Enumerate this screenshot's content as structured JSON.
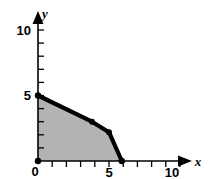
{
  "figure": {
    "background_color": "#ffffff",
    "region_fill_color": "#b3b3b3",
    "boundary_color": "#000000",
    "axis_color": "#000000"
  },
  "axes": {
    "x": {
      "name": "x",
      "tick_labels": [
        "0",
        "5",
        "10"
      ],
      "labeled_ticks": [
        0,
        5,
        10
      ],
      "minor_ticks": [
        1,
        2,
        3,
        4,
        6,
        7,
        8,
        9
      ],
      "range": [
        0,
        10
      ],
      "origin_label": "0"
    },
    "y": {
      "name": "y",
      "tick_labels": [
        "5",
        "10"
      ],
      "labeled_ticks": [
        5,
        10
      ],
      "minor_ticks": [
        1,
        2,
        3,
        4,
        6,
        7,
        8,
        9
      ],
      "range": [
        0,
        10
      ]
    }
  },
  "chart_data": {
    "type": "area",
    "title": "",
    "subtitle": "",
    "xlabel": "x",
    "ylabel": "y",
    "xlim": [
      0,
      10
    ],
    "ylim": [
      0,
      10
    ],
    "grid": false,
    "legend": null,
    "series": [
      {
        "name": "feasible-region-boundary",
        "type": "line",
        "closed_region": true,
        "fill": "#b3b3b3",
        "stroke": "#000000",
        "vertices": [
          {
            "x": 0,
            "y": 5
          },
          {
            "x": 3.8,
            "y": 3
          },
          {
            "x": 5.0,
            "y": 2.2
          },
          {
            "x": 5.9,
            "y": 0
          }
        ],
        "marked_points": [
          {
            "x": 0,
            "y": 5
          },
          {
            "x": 3.8,
            "y": 3
          },
          {
            "x": 5.0,
            "y": 2.2
          },
          {
            "x": 5.9,
            "y": 0
          },
          {
            "x": 0,
            "y": 0
          }
        ],
        "region_closure": [
          {
            "x": 5.9,
            "y": 0
          },
          {
            "x": 0,
            "y": 0
          }
        ]
      }
    ],
    "annotations": []
  }
}
